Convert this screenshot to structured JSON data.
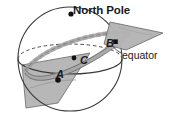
{
  "figure": {
    "kind": "sphere-plane-geometry-diagram",
    "labels": {
      "north_pole": "North Pole",
      "equator": "equator",
      "point_a": "A",
      "point_b": "B",
      "point_c": "C"
    },
    "colors": {
      "stroke": "#3a3a3a",
      "plane_fill": "#b4b4b4",
      "plane_stroke": "#6e6e6e",
      "band_fill": "#a8a8a8",
      "band_stroke": "#7a7a7a",
      "marker": "#111111",
      "background": "#ffffff",
      "text": "#1a1a1a"
    },
    "geometry": {
      "sphere": {
        "cx": 70,
        "cy": 59,
        "r": 52
      },
      "equator_ellipse": {
        "cx": 70,
        "cy": 59,
        "rx": 52,
        "ry": 15
      },
      "points": {
        "north_pole": {
          "x": 71,
          "y": 14
        },
        "a": {
          "x": 58,
          "y": 80
        },
        "b": {
          "x": 115,
          "y": 42
        },
        "c": {
          "x": 74,
          "y": 58
        }
      }
    }
  }
}
